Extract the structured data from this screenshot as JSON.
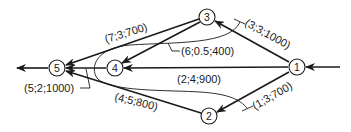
{
  "diagram": {
    "type": "network-flow-graph",
    "nodes": [
      {
        "id": "1",
        "label": "1",
        "x": 297,
        "y": 67
      },
      {
        "id": "2",
        "label": "2",
        "x": 209,
        "y": 116
      },
      {
        "id": "3",
        "label": "3",
        "x": 207,
        "y": 17
      },
      {
        "id": "4",
        "label": "4",
        "x": 115,
        "y": 68
      },
      {
        "id": "5",
        "label": "5",
        "x": 57,
        "y": 68
      }
    ],
    "edges": [
      {
        "from": "1",
        "to": "3",
        "label": "(3;3;1000)"
      },
      {
        "from": "1",
        "to": "2",
        "label": "(1;3;700)"
      },
      {
        "from": "1",
        "to": "4",
        "label": "(2;4;900)"
      },
      {
        "from": "3",
        "to": "5",
        "label": "(7;3;700)"
      },
      {
        "from": "3",
        "to": "4",
        "label": "(6;0.5;400)"
      },
      {
        "from": "4",
        "to": "5",
        "label": "(5;2;1000)"
      },
      {
        "from": "2",
        "to": "5",
        "label": "(4;5;800)"
      }
    ],
    "input_arrow": {
      "to": "1"
    },
    "output_arrow": {
      "from": "5"
    },
    "cut_curve": {
      "description": "U-shaped cut line enclosing node 4"
    }
  }
}
